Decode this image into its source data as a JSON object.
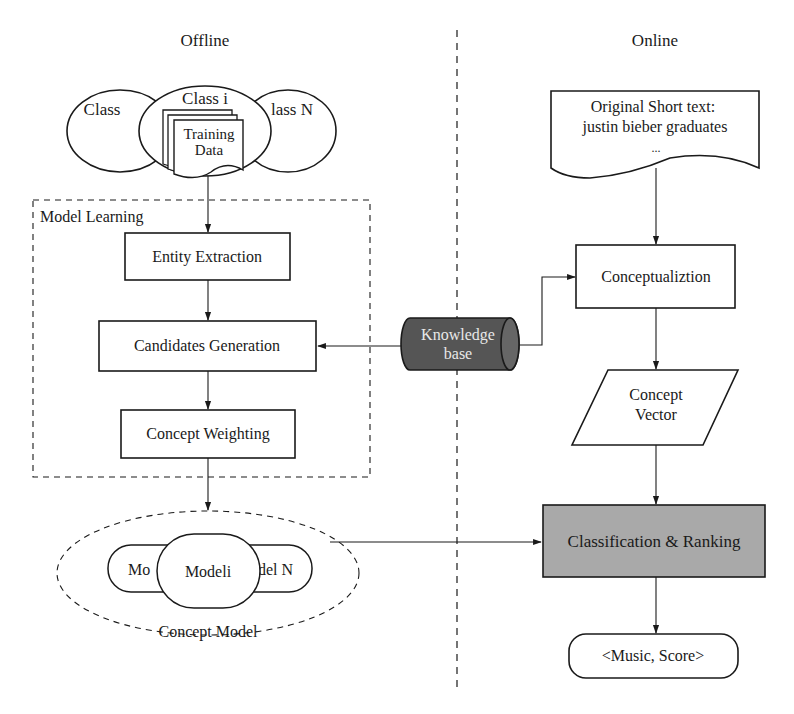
{
  "sections": {
    "offline_title": "Offline",
    "online_title": "Online"
  },
  "offline": {
    "classes": {
      "left": "Class",
      "middle": "Class i",
      "right": "lass N"
    },
    "training_data": {
      "line1": "Training",
      "line2": "Data"
    },
    "model_learning": {
      "title": "Model Learning",
      "steps": [
        {
          "label": "Entity Extraction"
        },
        {
          "label": "Candidates Generation"
        },
        {
          "label": "Concept Weighting"
        }
      ]
    },
    "concept_model": {
      "label": "Concept Model",
      "back_left": "Mo",
      "back_right": "del N",
      "front": "Modeli"
    }
  },
  "knowledge_base": {
    "line1": "Knowledge",
    "line2": "base"
  },
  "online": {
    "short_text": {
      "line1": "Original Short text:",
      "line2": "justin bieber graduates",
      "line3": "..."
    },
    "conceptualization": "Conceptualiztion",
    "concept_vector": {
      "line1": "Concept",
      "line2": "Vector"
    },
    "classification": "Classification & Ranking",
    "result": "<Music, Score>"
  },
  "colors": {
    "stroke": "#1a1a1a",
    "knowledge_base_fill": "#555555",
    "classification_fill": "#a9a9a9",
    "background": "#ffffff"
  }
}
